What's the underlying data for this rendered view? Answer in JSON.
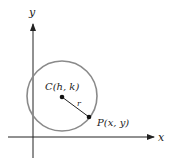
{
  "diagram": {
    "axes": {
      "x_label": "x",
      "y_label": "y"
    },
    "circle": {
      "stroke_color": "#8a8a8a"
    },
    "center": {
      "label": "C(h, k)"
    },
    "radius": {
      "label": "r"
    },
    "point": {
      "label": "P(x, y)"
    }
  }
}
